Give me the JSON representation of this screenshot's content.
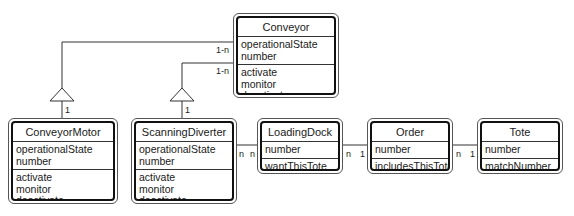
{
  "classes": {
    "conveyor": {
      "name": "Conveyor",
      "attributes": [
        "operationalState",
        "number"
      ],
      "operations": [
        "activate",
        "monitor",
        "deactivate"
      ]
    },
    "conveyor_motor": {
      "name": "ConveyorMotor",
      "attributes": [
        "operationalState",
        "number"
      ],
      "operations": [
        "activate",
        "monitor",
        "deactivate"
      ]
    },
    "scanning_diverter": {
      "name": "ScanningDiverter",
      "attributes": [
        "operationalState",
        "number"
      ],
      "operations": [
        "activate",
        "monitor",
        "deactivate"
      ]
    },
    "loading_dock": {
      "name": "LoadingDock",
      "attributes": [
        "number"
      ],
      "operations": [
        "wantThisTote"
      ]
    },
    "order": {
      "name": "Order",
      "attributes": [
        "number"
      ],
      "operations": [
        "includesThisTote"
      ]
    },
    "tote": {
      "name": "Tote",
      "attributes": [
        "number"
      ],
      "operations": [
        "matchNumber"
      ]
    }
  },
  "relations": {
    "conveyor_motor": {
      "conveyor_end": "1-n",
      "part_end": "1"
    },
    "scanning_diverter": {
      "conveyor_end": "1-n",
      "part_end": "1"
    },
    "diverter_dock": {
      "left": "n",
      "right": "n"
    },
    "dock_order": {
      "left": "n",
      "right": "1"
    },
    "order_tote": {
      "left": "n",
      "right": "1"
    }
  }
}
